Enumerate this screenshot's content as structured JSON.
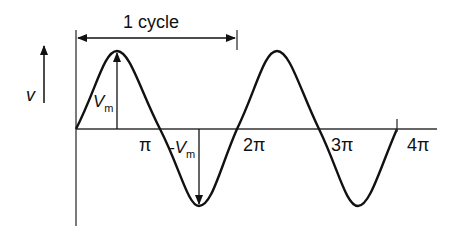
{
  "diagram": {
    "cycle_label": "1 cycle",
    "y_axis_label": "v",
    "peak_label": "V",
    "peak_sub": "m",
    "trough_label": "-V",
    "trough_sub": "m",
    "x_ticks": [
      "π",
      "2π",
      "3π",
      "4π"
    ],
    "colors": {
      "stroke": "#111111",
      "background": "#ffffff"
    }
  }
}
